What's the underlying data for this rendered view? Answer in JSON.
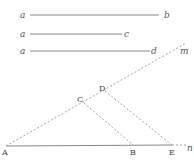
{
  "diagram": {
    "segments_given": [
      {
        "start_label": "a",
        "end_label": "b"
      },
      {
        "start_label": "a",
        "end_label": "c"
      },
      {
        "start_label": "a",
        "end_label": "d"
      }
    ],
    "points": {
      "A": "A",
      "B": "B",
      "C": "C",
      "D": "D",
      "E": "E",
      "m": "m",
      "n": "n"
    }
  }
}
